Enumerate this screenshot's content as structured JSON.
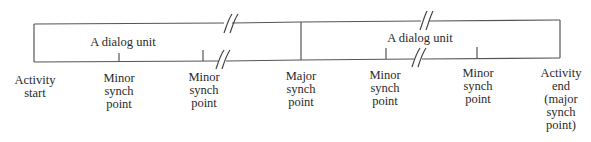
{
  "diagram": {
    "type": "activity-dialog-unit-timeline",
    "line_color": "#555555",
    "text_color": "#2a2a2a",
    "dialog_units": [
      {
        "label": "A dialog unit"
      },
      {
        "label": "A dialog unit"
      }
    ],
    "points": [
      {
        "kind": "activity-start",
        "lines": [
          "Activity",
          "start"
        ]
      },
      {
        "kind": "minor",
        "lines": [
          "Minor",
          "synch",
          "point"
        ]
      },
      {
        "kind": "minor",
        "lines": [
          "Minor",
          "synch",
          "point"
        ]
      },
      {
        "kind": "major",
        "lines": [
          "Major",
          "synch",
          "point"
        ]
      },
      {
        "kind": "minor",
        "lines": [
          "Minor",
          "synch",
          "point"
        ]
      },
      {
        "kind": "minor",
        "lines": [
          "Minor",
          "synch",
          "point"
        ]
      },
      {
        "kind": "activity-end",
        "lines": [
          "Activity",
          "end",
          "(major",
          "synch",
          "point)"
        ]
      }
    ]
  }
}
